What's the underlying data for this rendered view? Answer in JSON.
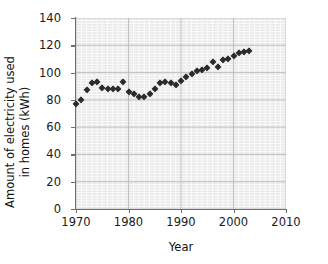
{
  "chart_data": {
    "type": "scatter",
    "title": "",
    "xlabel": "Year",
    "ylabel": "Amount of electricity used in homes (kWh)",
    "xlim": [
      1970,
      2010
    ],
    "ylim": [
      0,
      140
    ],
    "xticks": [
      1970,
      1980,
      1990,
      2000,
      2010
    ],
    "yticks": [
      0,
      20,
      40,
      60,
      80,
      100,
      120,
      140
    ],
    "grid": true,
    "grid_minor_step_x": 1,
    "grid_minor_step_y": 2,
    "legend": "none",
    "marker": "diamond",
    "marker_color": "#2b2b2b",
    "plot_bg": "#e9e9e9",
    "x": [
      1970,
      1971,
      1972,
      1973,
      1974,
      1975,
      1976,
      1977,
      1978,
      1979,
      1980,
      1981,
      1982,
      1983,
      1984,
      1985,
      1986,
      1987,
      1988,
      1989,
      1990,
      1991,
      1992,
      1993,
      1994,
      1995,
      1996,
      1997,
      1998,
      1999,
      2000,
      2001,
      2002,
      2003
    ],
    "y": [
      77,
      80,
      87,
      92,
      93,
      89,
      88,
      88,
      88,
      93,
      86,
      84,
      82,
      82,
      84,
      88,
      92,
      93,
      92,
      91,
      94,
      97,
      99,
      101,
      102,
      103,
      108,
      104,
      109,
      110,
      112,
      114,
      115,
      116
    ],
    "points": [
      {
        "year": 1970,
        "value": 77
      },
      {
        "year": 1971,
        "value": 80
      },
      {
        "year": 1972,
        "value": 87
      },
      {
        "year": 1973,
        "value": 92
      },
      {
        "year": 1974,
        "value": 93
      },
      {
        "year": 1975,
        "value": 89
      },
      {
        "year": 1976,
        "value": 88
      },
      {
        "year": 1977,
        "value": 88
      },
      {
        "year": 1978,
        "value": 88
      },
      {
        "year": 1979,
        "value": 93
      },
      {
        "year": 1980,
        "value": 86
      },
      {
        "year": 1981,
        "value": 84
      },
      {
        "year": 1982,
        "value": 82
      },
      {
        "year": 1983,
        "value": 82
      },
      {
        "year": 1984,
        "value": 84
      },
      {
        "year": 1985,
        "value": 88
      },
      {
        "year": 1986,
        "value": 92
      },
      {
        "year": 1987,
        "value": 93
      },
      {
        "year": 1988,
        "value": 92
      },
      {
        "year": 1989,
        "value": 91
      },
      {
        "year": 1990,
        "value": 94
      },
      {
        "year": 1991,
        "value": 97
      },
      {
        "year": 1992,
        "value": 99
      },
      {
        "year": 1993,
        "value": 101
      },
      {
        "year": 1994,
        "value": 102
      },
      {
        "year": 1995,
        "value": 103
      },
      {
        "year": 1996,
        "value": 108
      },
      {
        "year": 1997,
        "value": 104
      },
      {
        "year": 1998,
        "value": 109
      },
      {
        "year": 1999,
        "value": 110
      },
      {
        "year": 2000,
        "value": 112
      },
      {
        "year": 2001,
        "value": 114
      },
      {
        "year": 2002,
        "value": 115
      },
      {
        "year": 2003,
        "value": 116
      }
    ]
  },
  "axis": {
    "y_label_line1": "Amount of electricity used",
    "y_label_line2": "in homes (kWh)",
    "x_label": "Year",
    "y_tick_labels": [
      "0",
      "20",
      "40",
      "60",
      "80",
      "100",
      "120",
      "140"
    ],
    "x_tick_labels": [
      "1970",
      "1980",
      "1990",
      "2000",
      "2010"
    ]
  }
}
